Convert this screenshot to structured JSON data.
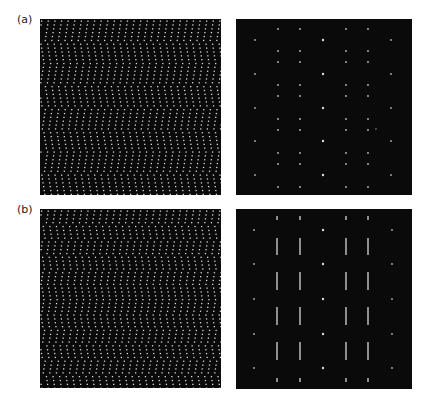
{
  "figure": {
    "rows": [
      {
        "label": "(a)",
        "label_pos": [
          17,
          14
        ],
        "real_space": {
          "box": [
            40,
            19,
            181,
            176
          ],
          "dot_spacing_x": 6.6,
          "row_spacing_y": 3.85,
          "dot_color": "#d8d8d8",
          "dot_size": 1.3,
          "chevron_period_y": 44,
          "chevron_shear": 0.35
        },
        "diffraction": {
          "box": [
            236,
            19,
            176,
            176
          ],
          "style": "sharp",
          "spot_color": "#e8e8e8",
          "columns_a": [
            19,
            87,
            155
          ],
          "rows_a": [
            21,
            55,
            89,
            122,
            156
          ],
          "columns_b": [
            42,
            64,
            110,
            132
          ],
          "rows_b": [
            10,
            32,
            43,
            66,
            77,
            100,
            111,
            134,
            145,
            168
          ],
          "extra_spots": [
            [
              140,
              110
            ]
          ]
        }
      },
      {
        "label": "(b)",
        "label_pos": [
          17,
          204
        ],
        "real_space": {
          "box": [
            40,
            209,
            181,
            179
          ],
          "dot_spacing_x": 6.6,
          "row_spacing_y": 3.85,
          "dot_color": "#d8d8d8",
          "dot_size": 1.3,
          "chevron_period_y": 30,
          "chevron_shear": 0.35
        },
        "diffraction": {
          "box": [
            236,
            209,
            176,
            180
          ],
          "style": "streaked",
          "spot_color": "#e8e8e8",
          "columns_a": [
            18,
            87,
            156
          ],
          "rows_a": [
            21,
            55,
            90,
            125,
            159
          ],
          "columns_b": [
            41,
            64,
            110,
            132
          ],
          "streaks_b": [
            [
              7,
              11
            ],
            [
              29,
              46
            ],
            [
              63,
              81
            ],
            [
              98,
              116
            ],
            [
              133,
              151
            ],
            [
              169,
              173
            ]
          ]
        }
      }
    ]
  }
}
